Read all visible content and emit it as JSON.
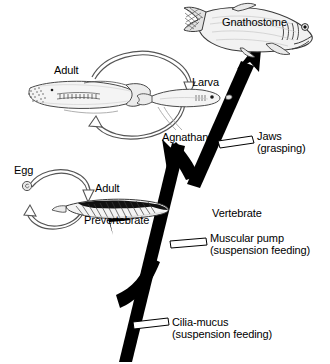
{
  "figure": {
    "background_color": "#ffffff",
    "ink_color": "#000000"
  },
  "taxa": {
    "gnathostome": "Gnathostome",
    "agnathan": "Agnathan",
    "prevertebrate": "Prevertebrate",
    "vertebrate": "Vertebrate"
  },
  "life_cycles": {
    "agnathan": {
      "stages": [
        {
          "label": "Adult"
        },
        {
          "label": "Larva"
        }
      ],
      "cycle_label": "Agnathan"
    },
    "prevertebrate": {
      "stages": [
        {
          "label": "Egg"
        },
        {
          "label": "Adult"
        }
      ],
      "cycle_label": "Prevertebrate"
    }
  },
  "characters": [
    {
      "id": "jaws",
      "name": "Jaws",
      "note": "(grasping)"
    },
    {
      "id": "muscular-pump",
      "name": "Muscular pump",
      "note": "(suspension feeding)"
    },
    {
      "id": "cilia-mucus",
      "name": "Cilia-mucus",
      "note": "(suspension feeding)"
    }
  ],
  "organisms": [
    {
      "id": "gnathostome-fish",
      "name": "jawed fish"
    },
    {
      "id": "lamprey-adult",
      "name": "adult lamprey"
    },
    {
      "id": "lamprey-larva",
      "name": "ammocoete larva"
    },
    {
      "id": "lancelet-adult",
      "name": "lancelet adult"
    },
    {
      "id": "egg",
      "name": "egg"
    }
  ]
}
